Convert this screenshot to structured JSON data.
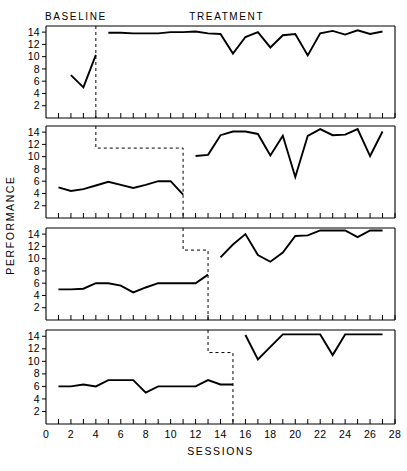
{
  "chart_data": {
    "type": "line",
    "title": "",
    "xlabel": "SESSIONS",
    "ylabel": "PERFORMANCE",
    "xlim": [
      0,
      28
    ],
    "ylim": [
      0,
      15
    ],
    "xticks": [
      0,
      1,
      2,
      3,
      4,
      5,
      6,
      7,
      8,
      9,
      10,
      11,
      12,
      13,
      14,
      15,
      16,
      17,
      18,
      19,
      20,
      21,
      22,
      23,
      24,
      25,
      26,
      27,
      28
    ],
    "xticklabels": [
      "0",
      "",
      "2",
      "",
      "4",
      "",
      "6",
      "",
      "8",
      "",
      "10",
      "",
      "12",
      "",
      "14",
      "",
      "16",
      "",
      "18",
      "",
      "20",
      "",
      "22",
      "",
      "24",
      "",
      "26",
      "",
      "28"
    ],
    "yticks": [
      2,
      4,
      6,
      8,
      10,
      12,
      14
    ],
    "yticklabels": [
      "2",
      "4",
      "6",
      "8",
      "10",
      "12",
      "14"
    ],
    "grid": false,
    "legend": null,
    "phase_headers": [
      {
        "label": "BASELINE",
        "x_center": 2.4
      },
      {
        "label": "TREATMENT",
        "x_center": 14.5
      }
    ],
    "design": "multiple-baseline across 4 subjects",
    "panels": [
      {
        "name": "panel-1",
        "phase_change_session": 4,
        "baseline": {
          "name": "BASELINE",
          "x": [
            2,
            3,
            4
          ],
          "y": [
            7,
            5,
            10.3
          ]
        },
        "treatment": {
          "name": "TREATMENT",
          "x": [
            5,
            6,
            7,
            8,
            9,
            10,
            11,
            12,
            13,
            14,
            15,
            16,
            17,
            18,
            19,
            20,
            21,
            22,
            23,
            24,
            25,
            26,
            27
          ],
          "y": [
            13.9,
            13.9,
            13.8,
            13.8,
            13.8,
            14,
            14,
            14.1,
            13.8,
            13.7,
            10.5,
            13.2,
            14,
            11.5,
            13.5,
            13.7,
            10.2,
            13.8,
            14.2,
            13.6,
            14.3,
            13.7,
            14.1
          ]
        }
      },
      {
        "name": "panel-2",
        "phase_change_session": 11,
        "baseline": {
          "name": "BASELINE",
          "x": [
            1,
            2,
            3,
            4,
            5,
            6,
            7,
            8,
            9,
            10,
            11
          ],
          "y": [
            5,
            4.4,
            4.7,
            5.3,
            5.9,
            5.4,
            4.9,
            5.4,
            6,
            6,
            3.8
          ]
        },
        "treatment": {
          "name": "TREATMENT",
          "x": [
            12,
            13,
            14,
            15,
            16,
            17,
            18,
            19,
            20,
            21,
            22,
            23,
            24,
            25,
            26,
            27
          ],
          "y": [
            10.1,
            10.3,
            13.5,
            14.1,
            14.1,
            13.7,
            10.2,
            13.4,
            6.7,
            13.4,
            14.5,
            13.5,
            13.6,
            14.5,
            10.1,
            14.1
          ]
        }
      },
      {
        "name": "panel-3",
        "phase_change_session": 13,
        "baseline": {
          "name": "BASELINE",
          "x": [
            1,
            2,
            3,
            4,
            5,
            6,
            7,
            8,
            9,
            10,
            11,
            12,
            13
          ],
          "y": [
            5,
            5,
            5.1,
            6,
            6,
            5.6,
            4.5,
            5.3,
            6,
            6,
            6,
            6,
            7.4
          ]
        },
        "treatment": {
          "name": "TREATMENT",
          "x": [
            14,
            15,
            16,
            17,
            18,
            19,
            20,
            21,
            22,
            23,
            24,
            25,
            26,
            27
          ],
          "y": [
            10.2,
            12.3,
            14,
            10.6,
            9.5,
            11,
            13.7,
            13.8,
            14.6,
            14.6,
            14.6,
            13.5,
            14.6,
            14.6
          ]
        }
      },
      {
        "name": "panel-4",
        "phase_change_session": 15,
        "baseline": {
          "name": "BASELINE",
          "x": [
            1,
            2,
            3,
            4,
            5,
            6,
            7,
            8,
            9,
            10,
            11,
            12,
            13,
            14,
            15
          ],
          "y": [
            6,
            6,
            6.3,
            6,
            7,
            7,
            7,
            5,
            6,
            6,
            6,
            6,
            7,
            6.3,
            6.3
          ]
        },
        "treatment": {
          "name": "TREATMENT",
          "x": [
            16,
            17,
            18,
            19,
            20,
            21,
            22,
            23,
            24,
            25,
            26,
            27
          ],
          "y": [
            14.2,
            10.3,
            12.3,
            14.3,
            14.3,
            14.3,
            14.3,
            11,
            14.3,
            14.3,
            14.3,
            14.3
          ]
        }
      }
    ],
    "phase_step_line": {
      "description": "dashed step line descending across panels at sessions 4, 11, 13, 15"
    }
  }
}
